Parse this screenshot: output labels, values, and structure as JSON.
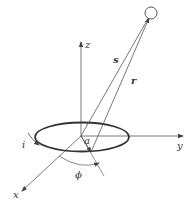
{
  "diagram": {
    "labels": {
      "z": "z",
      "y": "y",
      "x": "x",
      "s": "s",
      "r": "r",
      "a": "a",
      "i": "i",
      "phi": "ϕ"
    },
    "colors": {
      "line": "#555555",
      "ring": "#333333",
      "background": "#ffffff"
    }
  }
}
